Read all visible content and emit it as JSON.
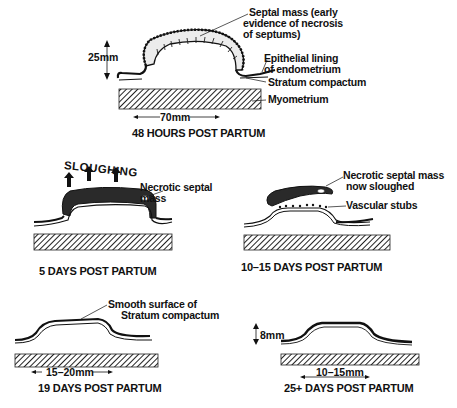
{
  "panels": [
    {
      "id": "48h",
      "caption": "48 HOURS POST PARTUM",
      "labels": {
        "septal_mass": [
          "Septal mass (early",
          "evidence of necrosis",
          "of septums)"
        ],
        "epithelial": [
          "Epithelial lining",
          "of endometrium"
        ],
        "stratum": "Stratum compactum",
        "myometrium": "Myometrium"
      },
      "dimensions": {
        "height": "25mm",
        "width": "70mm"
      }
    },
    {
      "id": "5d",
      "caption": "5 DAYS POST PARTUM",
      "labels": {
        "sloughing": "SLOUGHING",
        "necrotic": [
          "Necrotic septal",
          "mass"
        ]
      }
    },
    {
      "id": "10-15d",
      "caption": "10–15 DAYS POST PARTUM",
      "labels": {
        "necrotic_sloughed": [
          "Necrotic septal mass",
          "now sloughed"
        ],
        "vascular": "Vascular stubs"
      }
    },
    {
      "id": "19d",
      "caption": "19 DAYS POST PARTUM",
      "labels": {
        "smooth": [
          "Smooth surface of",
          "Stratum compactum"
        ]
      },
      "dimensions": {
        "width": "15–20mm"
      }
    },
    {
      "id": "25d",
      "caption": "25+ DAYS POST PARTUM",
      "dimensions": {
        "height": "8mm",
        "width": "10–15mm"
      }
    }
  ]
}
